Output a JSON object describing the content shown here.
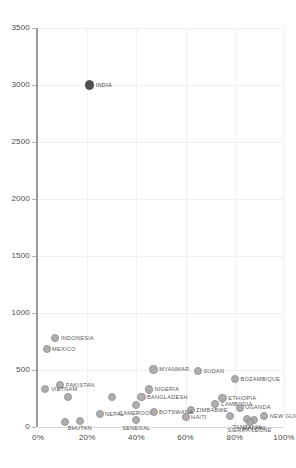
{
  "chart_data": {
    "type": "scatter",
    "title": "",
    "subtitle": "",
    "xlabel": "",
    "ylabel": "",
    "xlim": [
      0,
      100
    ],
    "ylim": [
      0,
      3500
    ],
    "x_tick_labels": [
      "0%",
      "20%",
      "40%",
      "60%",
      "80%",
      "100%"
    ],
    "x_tick_values": [
      0,
      20,
      40,
      60,
      80,
      100
    ],
    "y_tick_labels": [
      "0",
      "500",
      "1000",
      "1500",
      "2000",
      "2500",
      "3000",
      "3500"
    ],
    "y_tick_values": [
      0,
      500,
      1000,
      1500,
      2000,
      2500,
      3000,
      3500
    ],
    "x_unit": "percent",
    "grid": true,
    "legend": "none",
    "marker_color": "#a8a8a8",
    "marker_edge_color": "#8f8f8f",
    "highlight_color": "#4f4f4f",
    "axis_color": "#9a9a9a",
    "gridline_color": "#f0f0f0",
    "tick_text_color": "#4a4a4a",
    "label_text_color": "#585858",
    "points": [
      {
        "label": "INDIA",
        "x": 21.0,
        "y": 3000,
        "r": 4.6,
        "highlight": true,
        "label_pos": "right"
      },
      {
        "label": "INDONESIA",
        "x": 7.0,
        "y": 780,
        "r": 4.2,
        "highlight": false,
        "label_pos": "right"
      },
      {
        "label": "MEXICO",
        "x": 3.5,
        "y": 680,
        "r": 4.0,
        "highlight": false,
        "label_pos": "right"
      },
      {
        "label": "MYANMAR",
        "x": 47.0,
        "y": 505,
        "r": 4.2,
        "highlight": false,
        "label_pos": "right"
      },
      {
        "label": "SUDAN",
        "x": 65.0,
        "y": 490,
        "r": 4.0,
        "highlight": false,
        "label_pos": "right"
      },
      {
        "label": "BOZAMBIQUE",
        "x": 80.0,
        "y": 420,
        "r": 4.2,
        "highlight": false,
        "label_pos": "right"
      },
      {
        "label": "PAKISTAN",
        "x": 9.0,
        "y": 370,
        "r": 4.2,
        "highlight": false,
        "label_pos": "right"
      },
      {
        "label": "VIETNAM",
        "x": 3.0,
        "y": 330,
        "r": 4.0,
        "highlight": false,
        "label_pos": "right"
      },
      {
        "label": "NIGERIA",
        "x": 45.0,
        "y": 330,
        "r": 4.2,
        "highlight": false,
        "label_pos": "right"
      },
      {
        "label": "BANGLADESH",
        "x": 42.0,
        "y": 265,
        "r": 4.2,
        "highlight": false,
        "label_pos": "right"
      },
      {
        "label": "PHILIPPINES",
        "x": 12.0,
        "y": 260,
        "r": 4.0,
        "highlight": false,
        "label_pos": "left"
      },
      {
        "label": "LAO PDR",
        "x": 30.0,
        "y": 260,
        "r": 4.0,
        "highlight": false,
        "label_pos": "left"
      },
      {
        "label": "ETHIOPIA",
        "x": 75.0,
        "y": 255,
        "r": 4.2,
        "highlight": false,
        "label_pos": "right"
      },
      {
        "label": "CAMBODIA",
        "x": 72.0,
        "y": 200,
        "r": 4.0,
        "highlight": false,
        "label_pos": "right"
      },
      {
        "label": "CAMEROON",
        "x": 40.0,
        "y": 190,
        "r": 4.0,
        "highlight": false,
        "label_pos": "below"
      },
      {
        "label": "UGANDA",
        "x": 82.0,
        "y": 170,
        "r": 4.0,
        "highlight": false,
        "label_pos": "right"
      },
      {
        "label": "ZIMBABWE",
        "x": 62.0,
        "y": 150,
        "r": 4.0,
        "highlight": false,
        "label_pos": "right"
      },
      {
        "label": "BOTSWANA",
        "x": 47.0,
        "y": 130,
        "r": 4.0,
        "highlight": false,
        "label_pos": "right"
      },
      {
        "label": "NEPAL",
        "x": 25.0,
        "y": 110,
        "r": 4.0,
        "highlight": false,
        "label_pos": "right"
      },
      {
        "label": "KENYA",
        "x": 78.0,
        "y": 100,
        "r": 4.0,
        "highlight": false,
        "label_pos": "left"
      },
      {
        "label": "NEW GUINEA",
        "x": 92.0,
        "y": 95,
        "r": 4.0,
        "highlight": false,
        "label_pos": "right"
      },
      {
        "label": "HAITI",
        "x": 60.0,
        "y": 90,
        "r": 4.0,
        "highlight": false,
        "label_pos": "right"
      },
      {
        "label": "TANZANIA",
        "x": 85.0,
        "y": 70,
        "r": 4.0,
        "highlight": false,
        "label_pos": "below"
      },
      {
        "label": "SENEGAL",
        "x": 40.0,
        "y": 60,
        "r": 4.0,
        "highlight": false,
        "label_pos": "below"
      },
      {
        "label": "MALAWI",
        "x": 88.0,
        "y": 60,
        "r": 4.0,
        "highlight": false,
        "label_pos": "below"
      },
      {
        "label": "BHUTAN",
        "x": 17.0,
        "y": 55,
        "r": 4.0,
        "highlight": false,
        "label_pos": "below"
      },
      {
        "label": "SRI LANKA",
        "x": 11.0,
        "y": 45,
        "r": 4.0,
        "highlight": false,
        "label_pos": "left"
      },
      {
        "label": "SIERRA LEONE",
        "x": 86.0,
        "y": 40,
        "r": 4.0,
        "highlight": false,
        "label_pos": "below"
      }
    ]
  },
  "layout": {
    "plot_left": 38,
    "plot_top": 28,
    "plot_right": 284,
    "plot_bottom": 427
  }
}
